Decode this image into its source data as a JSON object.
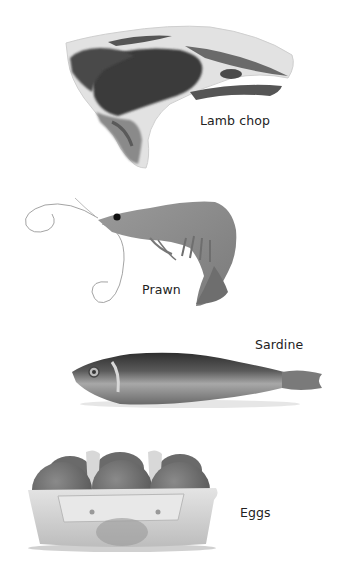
{
  "items": [
    {
      "id": "lamb-chop",
      "label": "Lamb chop"
    },
    {
      "id": "prawn",
      "label": "Prawn"
    },
    {
      "id": "sardine",
      "label": "Sardine"
    },
    {
      "id": "eggs",
      "label": "Eggs"
    }
  ],
  "colors": {
    "background": "#ffffff",
    "meat_dark": "#3a3a3a",
    "fat_light": "#e2e2e2",
    "prawn_body": "#8c8c8c",
    "sardine_dark": "#3c3c3c",
    "sardine_light": "#b4b4b4",
    "egg_shell": "#6e6e6e",
    "carton": "#d4d4d4"
  }
}
